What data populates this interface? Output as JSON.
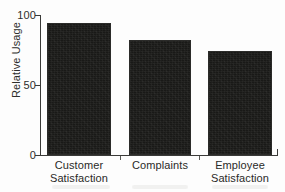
{
  "chart_data": {
    "type": "bar",
    "title": "",
    "subtitle": "",
    "xlabel": "",
    "ylabel": "Relative Usage",
    "categories": [
      "Customer Satisfaction",
      "Complaints",
      "Employee Satisfaction"
    ],
    "category_lines": [
      [
        "Customer",
        "Satisfaction"
      ],
      [
        "Complaints",
        ""
      ],
      [
        "Employee",
        "Satisfaction"
      ]
    ],
    "values": [
      94,
      82,
      74
    ],
    "ylim": [
      0,
      100
    ],
    "yticks": [
      0,
      50,
      100
    ],
    "ytick_labels": [
      "0",
      "50",
      "100"
    ],
    "grid": false,
    "legend": false,
    "legend_position": "none",
    "bar_color": "#191917",
    "axis_color": "#3a3a38",
    "background_color": "#fdfdfd"
  },
  "axis": {
    "y_title": "Relative Usage",
    "tick_100": "100",
    "tick_50": "50",
    "tick_0": "0"
  },
  "bars": [
    {
      "label_line1": "Customer",
      "label_line2": "Satisfaction",
      "value": 94
    },
    {
      "label_line1": "Complaints",
      "label_line2": "",
      "value": 82
    },
    {
      "label_line1": "Employee",
      "label_line2": "Satisfaction",
      "value": 74
    }
  ]
}
